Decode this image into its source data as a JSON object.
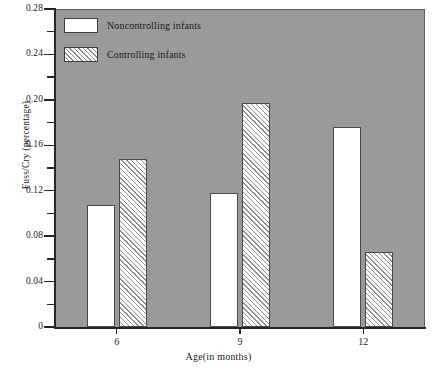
{
  "chart_data": {
    "type": "bar",
    "title": "",
    "xlabel": "Age(in months)",
    "ylabel": "Fuss/Cry (percentage)",
    "categories": [
      "6",
      "9",
      "12"
    ],
    "series": [
      {
        "name": "Noncontrolling infants",
        "values": [
          0.107,
          0.118,
          0.176
        ],
        "fill": "solid"
      },
      {
        "name": "Controlling infants",
        "values": [
          0.148,
          0.197,
          0.066
        ],
        "fill": "hatch"
      }
    ],
    "ylim": [
      0,
      0.28
    ],
    "y_major_ticks": [
      "0",
      "0.04",
      "0.08",
      "0.12",
      "0.16",
      "0.20",
      "0.24",
      "0.28"
    ],
    "y_major_values": [
      0,
      0.04,
      0.08,
      0.12,
      0.16,
      0.2,
      0.24,
      0.28
    ],
    "y_minor_values": [
      0.02,
      0.06,
      0.1,
      0.14,
      0.18,
      0.22,
      0.26
    ],
    "grid": false,
    "legend_position": "top-left",
    "plot_background": "#9a9a9a",
    "bar_edge_color": "#4a4a4a",
    "axis_color": "#262626"
  },
  "legend": {
    "items": [
      {
        "label": "Noncontrolling infants",
        "fill": "solid"
      },
      {
        "label": "Controlling infants",
        "fill": "hatch"
      }
    ]
  },
  "caption": {
    "remnant": ""
  }
}
